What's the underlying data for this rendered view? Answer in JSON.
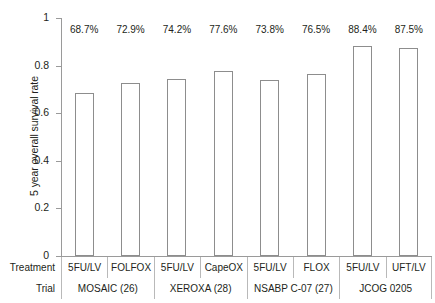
{
  "chart_data": {
    "type": "bar",
    "title": "",
    "xlabel": "",
    "ylabel": "5 year overall survival rate",
    "ylim": [
      0,
      1
    ],
    "yticks": [
      "0",
      "0.2",
      "0.4",
      "0.6",
      "0.8",
      "1"
    ],
    "ytick_values": [
      0,
      0.2,
      0.4,
      0.6,
      0.8,
      1
    ],
    "grid": false,
    "legend": "none",
    "bar_style": {
      "fill": "#ffffff",
      "edge": "#8d8d8d"
    },
    "categories": [
      "5FU/LV",
      "FOLFOX",
      "5FU/LV",
      "CapeOX",
      "5FU/LV",
      "FLOX",
      "5FU/LV",
      "UFT/LV"
    ],
    "values": [
      0.687,
      0.729,
      0.742,
      0.776,
      0.738,
      0.765,
      0.884,
      0.875
    ],
    "data_labels": [
      "68.7%",
      "72.9%",
      "74.2%",
      "77.6%",
      "73.8%",
      "76.5%",
      "88.4%",
      "87.5%"
    ],
    "groups": [
      {
        "label": "MOSAIC (26)",
        "span": 2
      },
      {
        "label": "XEROXA (28)",
        "span": 2
      },
      {
        "label": "NSABP C-07 (27)",
        "span": 2
      },
      {
        "label": "JCOG 0205",
        "span": 2
      }
    ]
  },
  "table": {
    "row_headers": {
      "treatment": "Treatment",
      "trial": "Trial"
    }
  }
}
